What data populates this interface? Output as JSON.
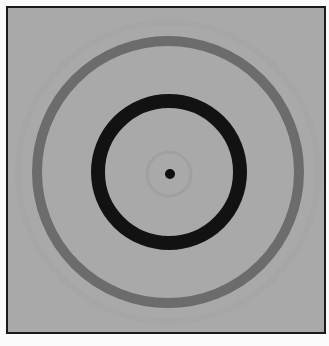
{
  "figure": {
    "colors": {
      "background": "#a9a9a9",
      "frame_border": "#1a1a1a",
      "outer_ring": "#6c6c6c",
      "inner_ring": "#121212",
      "center_dot": "#0e0e0e",
      "faint_halo": "#a0a0a0"
    },
    "rings": [
      {
        "name": "outer-gray-ring",
        "cx": 166,
        "cy": 170,
        "r": 131,
        "width": 10
      },
      {
        "name": "inner-black-ring",
        "cx": 167,
        "cy": 170,
        "r": 71,
        "width": 14
      },
      {
        "name": "faint-halo",
        "cx": 167,
        "cy": 172,
        "r": 22,
        "width": 3
      }
    ],
    "center_dot": {
      "cx": 168,
      "cy": 172,
      "r": 5
    }
  }
}
